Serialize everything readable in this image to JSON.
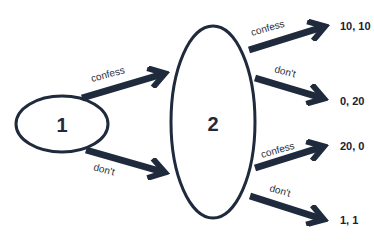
{
  "diagram": {
    "type": "game-tree",
    "colors": {
      "stroke": "#1f2a3c",
      "background": "#ffffff"
    },
    "nodes": [
      {
        "id": "1",
        "label": "1"
      },
      {
        "id": "2",
        "label": "2"
      }
    ],
    "player1_branches": [
      {
        "label": "confess"
      },
      {
        "label": "don't"
      }
    ],
    "player2_branches": [
      {
        "label": "confess",
        "payoff": "10, 10"
      },
      {
        "label": "don't",
        "payoff": "0, 20"
      },
      {
        "label": "confess",
        "payoff": "20, 0"
      },
      {
        "label": "don't",
        "payoff": "1, 1"
      }
    ]
  }
}
